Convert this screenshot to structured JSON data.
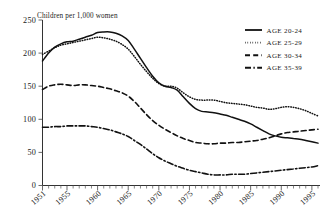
{
  "chart_data": {
    "type": "line",
    "title": "Children per 1,000 women",
    "xlabel": "",
    "ylabel": "Children per 1,000 women",
    "xlim": [
      1951,
      1996
    ],
    "ylim": [
      0,
      250
    ],
    "yticks": [
      0,
      50,
      100,
      150,
      200,
      250
    ],
    "xticks": [
      1951,
      1955,
      1960,
      1965,
      1970,
      1975,
      1980,
      1985,
      1990,
      1995
    ],
    "grid": false,
    "legend_position": "top-right",
    "x": [
      1951,
      1952,
      1953,
      1954,
      1955,
      1956,
      1957,
      1958,
      1959,
      1960,
      1961,
      1962,
      1963,
      1964,
      1965,
      1966,
      1967,
      1968,
      1969,
      1970,
      1971,
      1972,
      1973,
      1974,
      1975,
      1976,
      1977,
      1978,
      1979,
      1980,
      1981,
      1982,
      1983,
      1984,
      1985,
      1986,
      1987,
      1988,
      1989,
      1990,
      1991,
      1992,
      1993,
      1994,
      1995,
      1996
    ],
    "series": [
      {
        "name": "AGE 20-24",
        "style": "solid",
        "values": [
          188,
          200,
          209,
          214,
          217,
          218,
          221,
          224,
          227,
          231,
          232,
          232,
          230,
          226,
          219,
          206,
          192,
          178,
          165,
          155,
          150,
          148,
          144,
          134,
          124,
          116,
          112,
          111,
          110,
          108,
          106,
          103,
          100,
          97,
          93,
          88,
          83,
          78,
          75,
          73,
          72,
          71,
          70,
          68,
          66,
          64
        ]
      },
      {
        "name": "AGE 25-29",
        "style": "dotted",
        "values": [
          198,
          203,
          208,
          212,
          214,
          216,
          218,
          220,
          222,
          224,
          223,
          221,
          218,
          213,
          206,
          195,
          183,
          172,
          162,
          154,
          150,
          150,
          147,
          140,
          134,
          130,
          129,
          129,
          129,
          127,
          125,
          124,
          123,
          122,
          120,
          118,
          117,
          115,
          116,
          118,
          119,
          118,
          116,
          113,
          109,
          105
        ]
      },
      {
        "name": "AGE 30-34",
        "style": "dashed",
        "values": [
          145,
          150,
          152,
          153,
          152,
          151,
          152,
          152,
          151,
          150,
          148,
          146,
          143,
          140,
          135,
          127,
          117,
          107,
          98,
          91,
          85,
          80,
          75,
          71,
          68,
          65,
          64,
          63,
          63,
          64,
          64,
          65,
          65,
          66,
          67,
          68,
          70,
          72,
          75,
          78,
          80,
          81,
          82,
          83,
          84,
          85
        ]
      },
      {
        "name": "AGE 35-39",
        "style": "dashdot",
        "values": [
          88,
          88,
          89,
          89,
          90,
          90,
          90,
          90,
          89,
          88,
          86,
          84,
          81,
          78,
          74,
          68,
          62,
          55,
          48,
          42,
          37,
          33,
          29,
          26,
          23,
          21,
          19,
          17,
          16,
          16,
          16,
          17,
          17,
          17,
          18,
          19,
          20,
          21,
          22,
          23,
          24,
          25,
          26,
          27,
          28,
          30
        ]
      }
    ]
  },
  "legend": {
    "items": [
      {
        "label": "AGE 20-24",
        "style": "solid"
      },
      {
        "label": "AGE 25-29",
        "style": "dotted"
      },
      {
        "label": "AGE 30-34",
        "style": "dashed"
      },
      {
        "label": "AGE 35-39",
        "style": "dashdot"
      }
    ]
  },
  "axes": {
    "y_labels": [
      "250",
      "200",
      "150",
      "100",
      "50",
      "0"
    ],
    "x_labels": [
      "1951",
      "1955",
      "1960",
      "1965",
      "1970",
      "1975",
      "1980",
      "1985",
      "1990",
      "1995"
    ]
  }
}
